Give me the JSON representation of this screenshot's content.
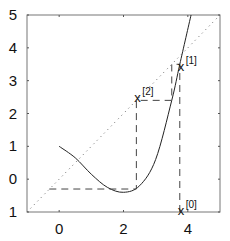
{
  "chart_data": {
    "type": "line",
    "title": "",
    "xlabel": "",
    "ylabel": "",
    "xlim": [
      -1,
      5
    ],
    "ylim": [
      -1,
      5
    ],
    "grid": false,
    "x_ticks": [
      0,
      2,
      4
    ],
    "x_tick_labels": [
      "0",
      "2",
      "4"
    ],
    "y_ticks": [
      -1,
      0,
      1,
      2,
      3,
      4,
      5
    ],
    "y_tick_labels": [
      "1",
      "0",
      "1",
      "2",
      "3",
      "4",
      "5"
    ],
    "series": [
      {
        "name": "f(x)",
        "style": "solid",
        "x": [
          0,
          0.5,
          1.0,
          1.5,
          2.0,
          2.5,
          3.0,
          3.5,
          3.75,
          4.1
        ],
        "y": [
          1.0,
          0.65,
          0.15,
          -0.25,
          -0.4,
          -0.2,
          0.6,
          2.4,
          3.5,
          5.0
        ]
      },
      {
        "name": "y = x",
        "style": "dotted",
        "x": [
          -1,
          5
        ],
        "y": [
          -1,
          5
        ]
      },
      {
        "name": "cobweb",
        "style": "dashed",
        "x": [
          3.75,
          3.75,
          3.5,
          3.5,
          2.4,
          2.4,
          -0.35
        ],
        "y": [
          -1,
          3.5,
          3.5,
          2.4,
          2.4,
          -0.3,
          -0.3
        ]
      }
    ],
    "annotations": [
      {
        "text": "x",
        "sup": "[0]",
        "x": 3.75,
        "y": -0.95
      },
      {
        "text": "x",
        "sup": "[1]",
        "x": 3.75,
        "y": 3.45
      },
      {
        "text": "x",
        "sup": "[2]",
        "x": 2.4,
        "y": 2.5
      }
    ]
  }
}
